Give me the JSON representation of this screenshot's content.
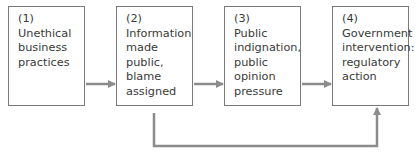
{
  "diagram": {
    "nodes": [
      {
        "num": "(1)",
        "lines": [
          "Unethical",
          "business",
          "practices"
        ]
      },
      {
        "num": "(2)",
        "lines": [
          "Information",
          "made public,",
          "blame",
          "assigned"
        ]
      },
      {
        "num": "(3)",
        "lines": [
          "Public",
          "indignation,",
          "public",
          "opinion",
          "pressure"
        ]
      },
      {
        "num": "(4)",
        "lines": [
          "Government",
          "intervention:",
          "regulatory",
          "action"
        ]
      }
    ],
    "edges": [
      {
        "from": 1,
        "to": 2
      },
      {
        "from": 2,
        "to": 3
      },
      {
        "from": 3,
        "to": 4
      },
      {
        "from": 2,
        "to": 4,
        "route": "below"
      }
    ],
    "colors": {
      "box_border": "#7a7a7a",
      "arrow": "#8c8c8c",
      "text": "#3a3a3a"
    }
  }
}
